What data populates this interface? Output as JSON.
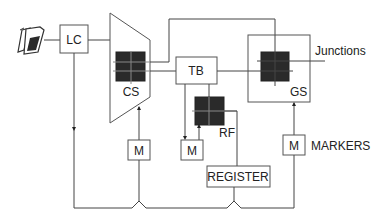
{
  "diagram": {
    "title": "",
    "nodes": {
      "telephone": {
        "label": "",
        "icon": "telephone-icon"
      },
      "line_circuit": {
        "label": "LC"
      },
      "concentrator_switch": {
        "label": "CS"
      },
      "trunk_block": {
        "label": "TB"
      },
      "register_finder": {
        "label": "RF"
      },
      "group_switch": {
        "label": "GS"
      },
      "marker_cs": {
        "label": "M"
      },
      "marker_rf": {
        "label": "M"
      },
      "marker_gs": {
        "label": "M"
      },
      "register": {
        "label": "REGISTER"
      }
    },
    "annotations": {
      "junctions": "Junctions",
      "markers": "MARKERS"
    },
    "edges": [
      {
        "from": "telephone",
        "to": "line_circuit"
      },
      {
        "from": "line_circuit",
        "to": "concentrator_switch"
      },
      {
        "from": "concentrator_switch",
        "to": "trunk_block"
      },
      {
        "from": "concentrator_switch",
        "to": "group_switch"
      },
      {
        "from": "trunk_block",
        "to": "group_switch"
      },
      {
        "from": "trunk_block",
        "to": "register_finder"
      },
      {
        "from": "trunk_block",
        "to": "marker_rf"
      },
      {
        "from": "marker_rf",
        "to": "register_finder"
      },
      {
        "from": "register_finder",
        "to": "register"
      },
      {
        "from": "marker_cs",
        "to": "concentrator_switch"
      },
      {
        "from": "marker_gs",
        "to": "group_switch"
      },
      {
        "from": "group_switch",
        "to": "junctions"
      },
      {
        "from": "line_circuit",
        "to": "control_bus"
      },
      {
        "from": "marker_cs",
        "to": "control_bus"
      },
      {
        "from": "register",
        "to": "control_bus"
      },
      {
        "from": "marker_gs",
        "to": "control_bus"
      }
    ]
  }
}
